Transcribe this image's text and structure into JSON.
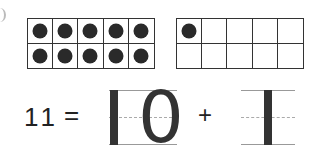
{
  "ten_frames": [
    {
      "name": "left",
      "rows": 2,
      "cols": 5,
      "filled": 10
    },
    {
      "name": "right",
      "rows": 2,
      "cols": 5,
      "filled": 1
    }
  ],
  "equation": {
    "total": "11",
    "equals": "=",
    "tens": "10",
    "tens_digit_one": "1",
    "tens_digit_zero": "0",
    "plus": "+",
    "ones": "1"
  },
  "colors": {
    "dot": "#2a2a2a",
    "grid": "#333333",
    "guide_line": "#999999"
  }
}
